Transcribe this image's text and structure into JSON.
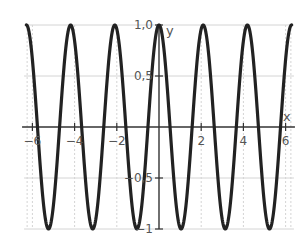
{
  "chart_data": {
    "type": "line",
    "title": "",
    "function": "y = cos(3x)",
    "xlabel": "x",
    "ylabel": "y",
    "xlim": [
      -6.3,
      6.3
    ],
    "ylim": [
      -1,
      1
    ],
    "x_ticks": [
      -6,
      -4,
      -2,
      2,
      4,
      6
    ],
    "x_tick_labels": [
      "−6",
      "−4",
      "−2",
      "2",
      "4",
      "6"
    ],
    "y_ticks": [
      1.0,
      0.5,
      -0.5,
      -1
    ],
    "y_tick_labels": [
      "1,0",
      "0,5",
      "−0,5",
      "−1"
    ],
    "grid": true,
    "legend": null,
    "series": [
      {
        "name": "cos(3x)",
        "color": "#222222",
        "x_range": [
          -6.2832,
          6.2832
        ],
        "peaks_x": [
          -6.2832,
          -4.1888,
          -2.0944,
          0,
          2.0944,
          4.1888,
          6.2832
        ],
        "troughs_x": [
          -5.236,
          -3.1416,
          -1.0472,
          1.0472,
          3.1416,
          5.236
        ],
        "amplitude": 1,
        "period": 2.0944
      }
    ]
  },
  "colors": {
    "curve": "#222222",
    "axis": "#333333",
    "grid": "#d4d4d4",
    "text": "#555555"
  },
  "axes": {
    "x_name": "x",
    "y_name": "y"
  }
}
